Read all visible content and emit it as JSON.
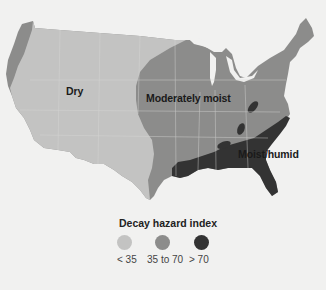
{
  "map": {
    "subject": "Contiguous United States",
    "regions": [
      {
        "id": "dry",
        "label": "Dry",
        "class": "< 35",
        "color": "#c3c3c2"
      },
      {
        "id": "moderate",
        "label": "Moderately moist",
        "class": "35 to 70",
        "color": "#8c8c8b"
      },
      {
        "id": "humid",
        "label": "Moist/humid",
        "class": "> 70",
        "color": "#333333"
      }
    ],
    "labels": {
      "dry": "Dry",
      "moderate": "Moderately moist",
      "humid": "Moist/humid"
    }
  },
  "legend": {
    "title": "Decay hazard index",
    "items": [
      {
        "label": "< 35",
        "color": "#c3c3c2"
      },
      {
        "label": "35 to 70",
        "color": "#8c8c8b"
      },
      {
        "label": "> 70",
        "color": "#333333"
      }
    ]
  },
  "colors": {
    "background": "#f1f1f0",
    "dry": "#c3c3c2",
    "moderate": "#8c8c8b",
    "humid": "#333333",
    "state_borders": "#d8d8d6"
  }
}
